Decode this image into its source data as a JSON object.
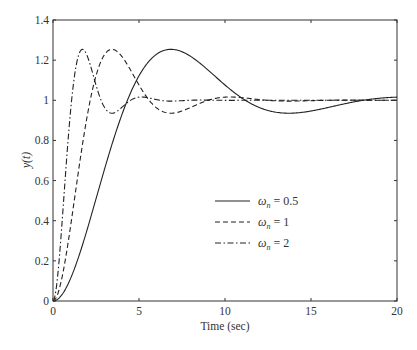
{
  "chart_data": {
    "type": "line",
    "title": "",
    "xlabel": "Time (sec)",
    "ylabel": "y(t)",
    "xlim": [
      0,
      20
    ],
    "ylim": [
      0,
      1.4
    ],
    "xticks": [
      0,
      5,
      10,
      15,
      20
    ],
    "xtick_labels": [
      "0",
      "5",
      "10",
      "15",
      "20"
    ],
    "yticks": [
      0,
      0.2,
      0.4,
      0.6,
      0.8,
      1.0,
      1.2,
      1.4
    ],
    "ytick_labels": [
      "0",
      "0.2",
      "0.4",
      "0.6",
      "0.8",
      "1",
      "1.2",
      "1.4"
    ],
    "grid": false,
    "legend_position": "center-lower",
    "damping_ratio": 0.4,
    "series": [
      {
        "name": "ωn = 0.5",
        "omega_n": 0.5,
        "style": "solid",
        "x": [
          0,
          1,
          2,
          3,
          4,
          5,
          6,
          6.86,
          8,
          9,
          10,
          11,
          12,
          13.7,
          15,
          16,
          17,
          18,
          19,
          20
        ],
        "values": [
          0,
          0.11,
          0.36,
          0.64,
          0.89,
          1.07,
          1.19,
          1.25,
          1.22,
          1.15,
          1.07,
          1.0,
          0.96,
          0.94,
          0.95,
          0.97,
          0.99,
          1.0,
          1.01,
          1.01
        ]
      },
      {
        "name": "ωn = 1",
        "omega_n": 1,
        "style": "dashed",
        "x": [
          0,
          0.5,
          1,
          1.5,
          2,
          2.5,
          3,
          3.43,
          4,
          5,
          6,
          6.86,
          8,
          9,
          10,
          11,
          12,
          14,
          16,
          18,
          20
        ],
        "values": [
          0,
          0.11,
          0.36,
          0.64,
          0.89,
          1.07,
          1.19,
          1.25,
          1.22,
          1.07,
          0.96,
          0.94,
          0.97,
          1.0,
          1.01,
          1.01,
          1.0,
          1.0,
          1.0,
          1.0,
          1.0
        ]
      },
      {
        "name": "ωn = 2",
        "omega_n": 2,
        "style": "dashdot",
        "x": [
          0,
          0.5,
          1,
          1.5,
          1.71,
          2,
          2.5,
          3,
          3.43,
          4,
          5,
          6,
          8,
          10,
          15,
          20
        ],
        "values": [
          0,
          0.36,
          0.89,
          1.19,
          1.25,
          1.22,
          1.07,
          0.96,
          0.94,
          0.97,
          1.01,
          1.0,
          1.0,
          1.0,
          1.0,
          1.0
        ]
      }
    ]
  },
  "legend": [
    {
      "symbol": "ω",
      "sub": "n",
      "rest": " = 0.5"
    },
    {
      "symbol": "ω",
      "sub": "n",
      "rest": " = 1"
    },
    {
      "symbol": "ω",
      "sub": "n",
      "rest": " = 2"
    }
  ],
  "colors": {
    "axis": "#333333",
    "line": "#222222"
  }
}
